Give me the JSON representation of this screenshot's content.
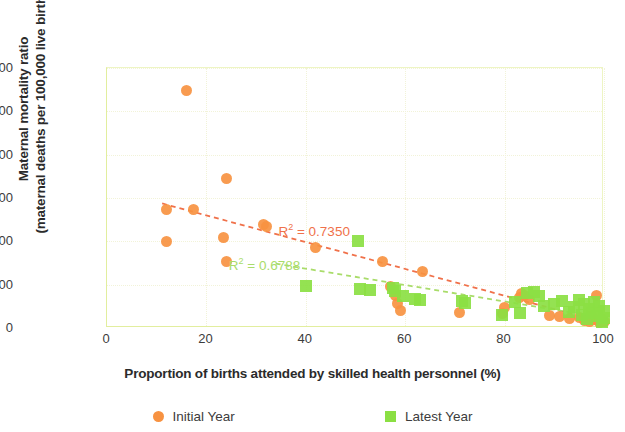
{
  "chart_data": {
    "type": "scatter",
    "title": "",
    "xlabel": "Proportion of births attended by skilled health personnel (%)",
    "ylabel_line1": "Maternal mortality ratio",
    "ylabel_line2": "(maternal deaths per 100,000 live births)",
    "xlim": [
      0,
      100
    ],
    "ylim": [
      0,
      1200
    ],
    "xticks": [
      "0",
      "20",
      "40",
      "60",
      "80",
      "100"
    ],
    "xtick_values": [
      0,
      20,
      40,
      60,
      80,
      100
    ],
    "yticks": [
      "0",
      "200",
      "400",
      "600",
      "800",
      "1,000",
      "1,200"
    ],
    "ytick_values": [
      0,
      200,
      400,
      600,
      800,
      1000,
      1200
    ],
    "grid": "dotted light gridlines on both axes",
    "legend_position": "bottom-center",
    "colors": {
      "initial_year": "#f79241",
      "latest_year": "#8bdf43",
      "axis_frame": "#e2ee9e",
      "gridline": "#f2f3d8",
      "text": "#3c3c3c",
      "r2_initial": "#f0714a",
      "r2_latest": "#a9dc6a"
    },
    "series": [
      {
        "name": "Initial Year",
        "marker": "circle",
        "color": "#f79241",
        "points": [
          [
            12,
            545
          ],
          [
            12,
            398
          ],
          [
            16,
            1098
          ],
          [
            17.5,
            545
          ],
          [
            23.5,
            418
          ],
          [
            24,
            690
          ],
          [
            24,
            305
          ],
          [
            31.5,
            480
          ],
          [
            32,
            470
          ],
          [
            42,
            370
          ],
          [
            55.5,
            305
          ],
          [
            57,
            190
          ],
          [
            58,
            150
          ],
          [
            58.5,
            115
          ],
          [
            59,
            80
          ],
          [
            63.5,
            260
          ],
          [
            71,
            70
          ],
          [
            79.5,
            65
          ],
          [
            80,
            95
          ],
          [
            83,
            140
          ],
          [
            83.5,
            160
          ],
          [
            84,
            150
          ],
          [
            85,
            130
          ],
          [
            89,
            60
          ],
          [
            91,
            55
          ],
          [
            93,
            45
          ],
          [
            95,
            50
          ],
          [
            96,
            35
          ],
          [
            97,
            30
          ],
          [
            97.5,
            60
          ],
          [
            98,
            40
          ],
          [
            98.5,
            150
          ],
          [
            99,
            25
          ],
          [
            99.5,
            45
          ],
          [
            100,
            30
          ]
        ]
      },
      {
        "name": "Latest Year",
        "marker": "square",
        "color": "#8bdf43",
        "points": [
          [
            40,
            195
          ],
          [
            50.5,
            400
          ],
          [
            51,
            180
          ],
          [
            53,
            175
          ],
          [
            57.5,
            185
          ],
          [
            58,
            170
          ],
          [
            59.5,
            150
          ],
          [
            62,
            135
          ],
          [
            63,
            130
          ],
          [
            71.5,
            125
          ],
          [
            72,
            115
          ],
          [
            79.5,
            60
          ],
          [
            82,
            120
          ],
          [
            83,
            70
          ],
          [
            84.5,
            160
          ],
          [
            86,
            165
          ],
          [
            87,
            150
          ],
          [
            88,
            100
          ],
          [
            90,
            110
          ],
          [
            91.5,
            125
          ],
          [
            93,
            75
          ],
          [
            94,
            95
          ],
          [
            95,
            130
          ],
          [
            95.5,
            60
          ],
          [
            96,
            110
          ],
          [
            96.5,
            40
          ],
          [
            97,
            90
          ],
          [
            97.5,
            70
          ],
          [
            98,
            120
          ],
          [
            98.5,
            55
          ],
          [
            99,
            100
          ],
          [
            99.5,
            30
          ],
          [
            100,
            80
          ],
          [
            100,
            45
          ]
        ]
      }
    ],
    "trendlines": [
      {
        "name": "Initial Year trend",
        "color": "#f0714a",
        "style": "dashed",
        "x_start": 11,
        "y_start": 570,
        "x_end": 100,
        "y_end": 20,
        "r2_label": "R² = 0.7350",
        "r2_value": 0.735
      },
      {
        "name": "Latest Year trend",
        "color": "#a9dc6a",
        "style": "dashed",
        "x_start": 34,
        "y_start": 290,
        "x_end": 100,
        "y_end": 40,
        "r2_label": "R² = 0.6788",
        "r2_value": 0.6788
      }
    ],
    "annotations": [
      {
        "text": "R² = 0.7350",
        "color": "#f0714a",
        "x": 34.5,
        "y": 450
      },
      {
        "text": "R² = 0.6788",
        "color": "#a9dc6a",
        "x": 24.5,
        "y": 290
      }
    ],
    "legend": [
      {
        "label": "Initial Year",
        "marker": "circle",
        "color": "#f79241"
      },
      {
        "label": "Latest Year",
        "marker": "square",
        "color": "#8bdf43"
      }
    ]
  }
}
